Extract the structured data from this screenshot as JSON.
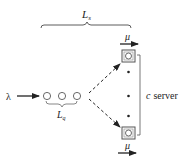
{
  "diagram": {
    "type": "queueing-system",
    "labels": {
      "system_length": "L",
      "system_length_sub": "s",
      "queue_length": "L",
      "queue_length_sub": "q",
      "arrival_rate": "λ",
      "service_rate_top": "μ",
      "service_rate_bottom": "μ",
      "servers_c": "c",
      "servers_text": "server"
    },
    "queue_customers": 3,
    "servers_shown": 2,
    "ellipsis_dots": 3,
    "colors": {
      "stroke": "#222222",
      "server_box": "#666666",
      "background": "#ffffff"
    }
  }
}
